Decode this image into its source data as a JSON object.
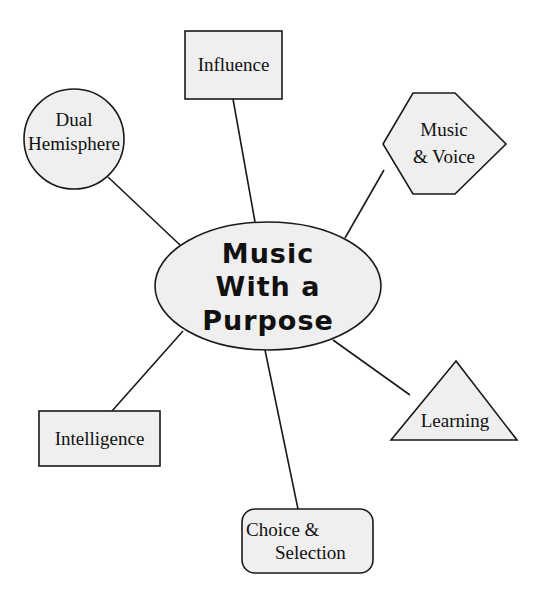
{
  "diagram": {
    "type": "mind-map",
    "center": {
      "label_lines": [
        "Music",
        "With a",
        "Purpose"
      ],
      "shape": "ellipse"
    },
    "nodes": [
      {
        "id": "influence",
        "shape": "rectangle",
        "label_lines": [
          "Influence"
        ]
      },
      {
        "id": "dual-hemisphere",
        "shape": "circle",
        "label_lines": [
          "Dual",
          "Hemisphere"
        ]
      },
      {
        "id": "music-voice",
        "shape": "hexagon",
        "label_lines": [
          "Music",
          "& Voice"
        ]
      },
      {
        "id": "intelligence",
        "shape": "rectangle",
        "label_lines": [
          "Intelligence"
        ]
      },
      {
        "id": "choice-selection",
        "shape": "rounded-rectangle",
        "label_lines": [
          "Choice &",
          "Selection"
        ]
      },
      {
        "id": "learning",
        "shape": "triangle",
        "label_lines": [
          "Learning"
        ]
      }
    ],
    "colors": {
      "fill": "#efefef",
      "stroke": "#1a1a1a",
      "text": "#111111"
    }
  }
}
